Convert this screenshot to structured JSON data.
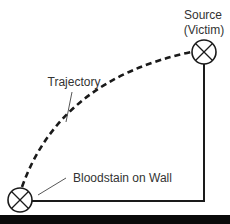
{
  "diagram": {
    "labels": {
      "source_line1": "Source",
      "source_line2": "(Victim)",
      "trajectory": "Trajectory",
      "bloodstain": "Bloodstain on Wall"
    },
    "nodes": [
      {
        "id": "source",
        "label": "Source (Victim)",
        "icon": "circle-x-marker",
        "cx": 204,
        "cy": 52
      },
      {
        "id": "bloodstain",
        "label": "Bloodstain on Wall",
        "icon": "circle-x-marker",
        "cx": 20,
        "cy": 200
      }
    ],
    "edges": [
      {
        "from": "source",
        "to": "bloodstain",
        "style": "dashed-curve",
        "label": "Trajectory"
      },
      {
        "from": "source",
        "to": "bloodstain",
        "style": "solid-right-angle"
      }
    ],
    "colors": {
      "line": "#1a1a1a",
      "text": "#333333",
      "background": "#ffffff",
      "bottom_bar": "#0a0a0a"
    }
  }
}
